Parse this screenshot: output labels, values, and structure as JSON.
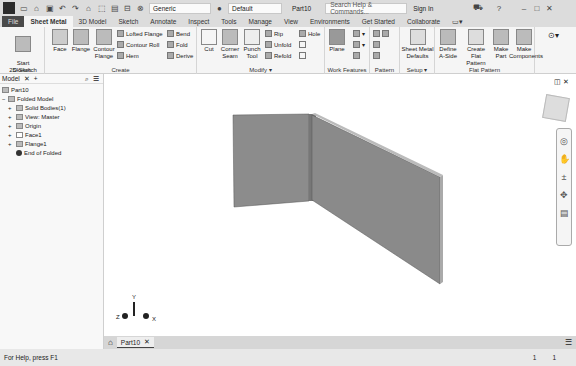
{
  "titlebar": {
    "quick_access": [
      "new-icon",
      "open-icon",
      "save-icon",
      "undo-icon",
      "redo-icon",
      "home-icon",
      "select-icon",
      "print-icon",
      "measure-icon",
      "material-icon"
    ],
    "material_dropdown": "Generic",
    "appearance_dropdown": "Default",
    "document_title": "Part10",
    "search_placeholder": "Search Help & Commands...",
    "sign_in": "Sign In",
    "help": "?",
    "window_controls": [
      "minimize",
      "maximize",
      "close"
    ]
  },
  "ribbon_tabs": [
    {
      "label": "File"
    },
    {
      "label": "Sheet Metal",
      "active": true
    },
    {
      "label": "3D Model"
    },
    {
      "label": "Sketch"
    },
    {
      "label": "Annotate"
    },
    {
      "label": "Inspect"
    },
    {
      "label": "Tools"
    },
    {
      "label": "Manage"
    },
    {
      "label": "View"
    },
    {
      "label": "Environments"
    },
    {
      "label": "Get Started"
    },
    {
      "label": "Collaborate"
    }
  ],
  "ribbon": {
    "sketch": {
      "label": "Sketch",
      "start_2d_sketch": "Start\n2D Sketch"
    },
    "create": {
      "label": "Create",
      "face": "Face",
      "flange": "Flange",
      "contour_flange": "Contour\nFlange",
      "lofted_flange": "Lofted Flange",
      "contour_roll": "Contour Roll",
      "hem": "Hem",
      "bend": "Bend",
      "fold": "Fold",
      "derive": "Derive"
    },
    "modify": {
      "label": "Modify ▾",
      "cut": "Cut",
      "corner_seam": "Corner\nSeam",
      "punch_tool": "Punch\nTool",
      "rip": "Rip",
      "unfold": "Unfold",
      "refold": "Refold",
      "hole": "Hole"
    },
    "work_features": {
      "label": "Work Features",
      "plane": "Plane"
    },
    "pattern": {
      "label": "Pattern"
    },
    "setup": {
      "label": "Setup ▾",
      "sheet_metal_defaults": "Sheet Metal\nDefaults"
    },
    "flat_pattern": {
      "label": "Flat Pattern",
      "define_a_side": "Define\nA-Side",
      "create_flat_pattern": "Create\nFlat Pattern",
      "make_part": "Make\nPart",
      "make_components": "Make\nComponents"
    }
  },
  "browser": {
    "tab_label": "Model",
    "tree": [
      {
        "label": "Part10",
        "level": 0
      },
      {
        "label": "Folded Model",
        "level": 0,
        "expand": "−"
      },
      {
        "label": "Solid Bodies(1)",
        "level": 1,
        "expand": "+"
      },
      {
        "label": "View: Master",
        "level": 1,
        "expand": "+"
      },
      {
        "label": "Origin",
        "level": 1,
        "expand": "+"
      },
      {
        "label": "Face1",
        "level": 1,
        "expand": "+"
      },
      {
        "label": "Flange1",
        "level": 1,
        "expand": "+"
      },
      {
        "label": "End of Folded",
        "level": 1
      }
    ]
  },
  "document_tabs": [
    {
      "label": "Part10",
      "closable": true
    }
  ],
  "status": {
    "help_text": "For Help, press F1",
    "count_a": "1",
    "count_b": "1"
  },
  "triad": {
    "x": "X",
    "y": "Y",
    "z": "Z"
  },
  "colors": {
    "accent": "#4a4a4a",
    "panel_face": "#8a8a8a",
    "canvas": "#ffffff"
  }
}
